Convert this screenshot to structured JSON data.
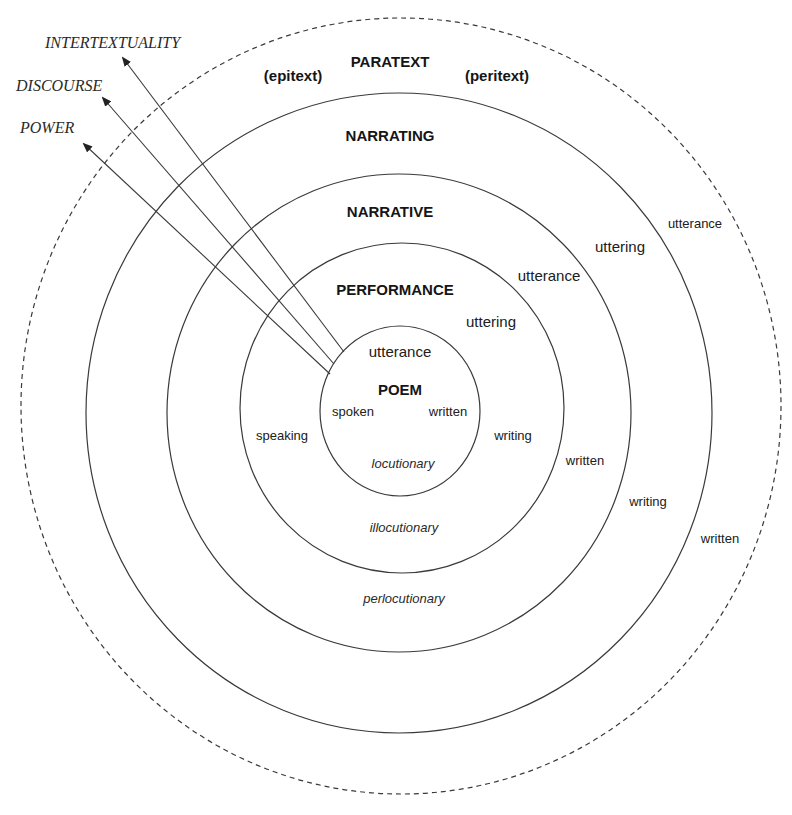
{
  "diagram": {
    "type": "concentric-circles",
    "colors": {
      "stroke": "#3a3a3a",
      "text": "#151515",
      "background": "#ffffff"
    },
    "arrows": [
      {
        "label": "INTERTEXTUALITY"
      },
      {
        "label": "DISCOURSE"
      },
      {
        "label": "POWER"
      }
    ],
    "rings": {
      "paratext": {
        "title": "PARATEXT",
        "left_note": "(epitext)",
        "right_note": "(peritext)",
        "utterance": "utterance",
        "written": "written"
      },
      "narrating": {
        "title": "NARRATING",
        "uttering": "uttering",
        "writing": "writing"
      },
      "narrative": {
        "title": "NARRATIVE",
        "utterance": "utterance",
        "written": "written",
        "perlocutionary": "perlocutionary"
      },
      "performance": {
        "title": "PERFORMANCE",
        "uttering": "uttering",
        "speaking": "speaking",
        "writing": "writing",
        "illocutionary": "illocutionary"
      },
      "poem": {
        "title": "POEM",
        "utterance": "utterance",
        "spoken": "spoken",
        "written": "written",
        "locutionary": "locutionary"
      }
    }
  }
}
